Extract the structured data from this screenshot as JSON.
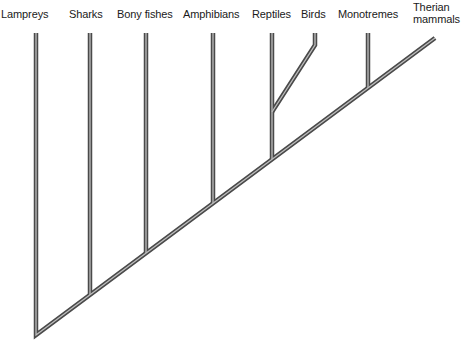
{
  "diagram": {
    "type": "cladogram",
    "taxa": [
      {
        "name": "Lampreys",
        "label_x": 1,
        "label_y": 8,
        "branch_x": 36,
        "join_y": 335
      },
      {
        "name": "Sharks",
        "label_x": 69,
        "label_y": 8,
        "branch_x": 90,
        "join_y": 295
      },
      {
        "name": "Bony fishes",
        "label_x": 117,
        "label_y": 8,
        "branch_x": 146,
        "join_y": 253
      },
      {
        "name": "Amphibians",
        "label_x": 183,
        "label_y": 8,
        "branch_x": 213,
        "join_y": 203
      },
      {
        "name": "Reptiles",
        "label_x": 252,
        "label_y": 8,
        "branch_x": 272,
        "join_y": 159
      },
      {
        "name": "Birds",
        "label_x": 301,
        "label_y": 8,
        "branch_x": 315,
        "join_y": 112
      },
      {
        "name": "Monotremes",
        "label_x": 338,
        "label_y": 8,
        "branch_x": 368,
        "join_y": 88
      },
      {
        "name": "Therian\nmammals",
        "label_x": 413,
        "label_y": 1,
        "branch_x": 435,
        "join_y": 38
      }
    ],
    "line_color": "#4a4a4a",
    "line_highlight": "#bdbdbd",
    "tip_y": 33
  }
}
